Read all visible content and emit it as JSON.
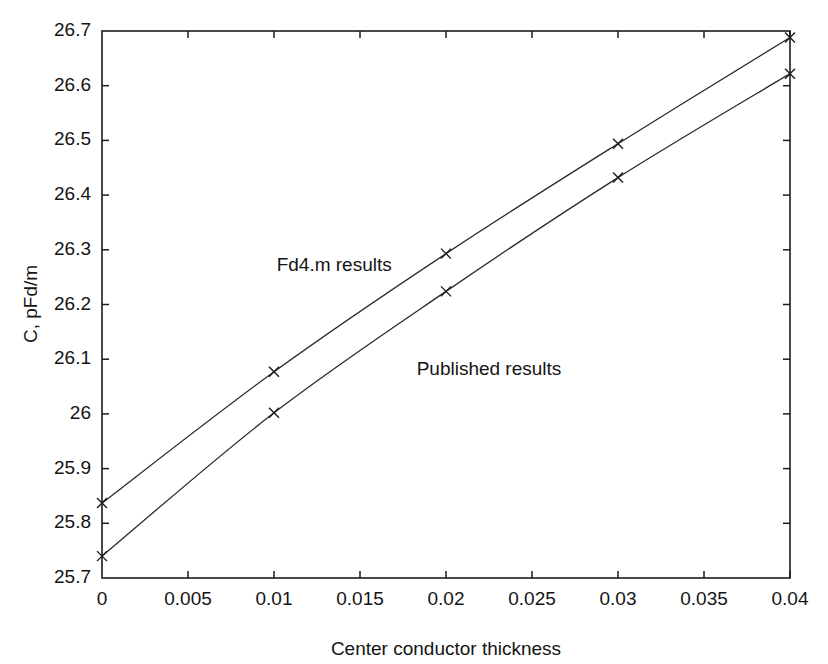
{
  "chart_data": {
    "type": "line",
    "title": "",
    "xlabel": "Center conductor thickness",
    "ylabel": "C, pFd/m",
    "xlim": [
      0,
      0.04
    ],
    "ylim": [
      25.7,
      26.7
    ],
    "grid": false,
    "legend_position": "inline-annotations",
    "x": [
      0,
      0.01,
      0.02,
      0.03,
      0.04
    ],
    "xticks": [
      "0",
      "0.005",
      "0.01",
      "0.015",
      "0.02",
      "0.025",
      "0.03",
      "0.035",
      "0.04"
    ],
    "xtick_values": [
      0,
      0.005,
      0.01,
      0.015,
      0.02,
      0.025,
      0.03,
      0.035,
      0.04
    ],
    "yticks": [
      "25.7",
      "25.8",
      "25.9",
      "26",
      "26.1",
      "26.2",
      "26.3",
      "26.4",
      "26.5",
      "26.6",
      "26.7"
    ],
    "ytick_values": [
      25.7,
      25.8,
      25.9,
      26.0,
      26.1,
      26.2,
      26.3,
      26.4,
      26.5,
      26.6,
      26.7
    ],
    "marker": "x",
    "line_color": "#2a2a2a",
    "series": [
      {
        "name": "Fd4.m results",
        "values": [
          25.837,
          26.077,
          26.293,
          26.494,
          26.688
        ],
        "annotation": "Fd4.m results",
        "annotation_x": 0.0135,
        "annotation_y": 26.27
      },
      {
        "name": "Published results",
        "values": [
          25.74,
          26.002,
          26.224,
          26.432,
          26.622
        ],
        "annotation": "Published results",
        "annotation_x": 0.0225,
        "annotation_y": 26.08
      }
    ]
  }
}
